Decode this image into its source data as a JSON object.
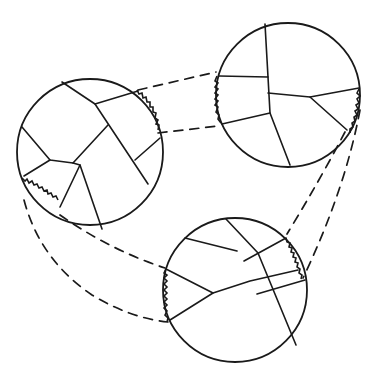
{
  "diagram": {
    "type": "schematic",
    "colors": {
      "ink": "#1a1a1a",
      "background": "#ffffff"
    },
    "nodes": [
      {
        "id": "left-circle",
        "cx": 90,
        "cy": 152,
        "r": 73
      },
      {
        "id": "top-right-circle",
        "cx": 288,
        "cy": 95,
        "r": 72
      },
      {
        "id": "bottom-circle",
        "cx": 235,
        "cy": 290,
        "r": 72
      }
    ],
    "edges": [
      {
        "from": "left-circle",
        "to": "top-right-circle",
        "style": "dashed",
        "count": 2
      },
      {
        "from": "left-circle",
        "to": "bottom-circle",
        "style": "dashed",
        "count": 2
      },
      {
        "from": "top-right-circle",
        "to": "bottom-circle",
        "style": "dashed",
        "count": 2
      }
    ],
    "text_labels": []
  }
}
